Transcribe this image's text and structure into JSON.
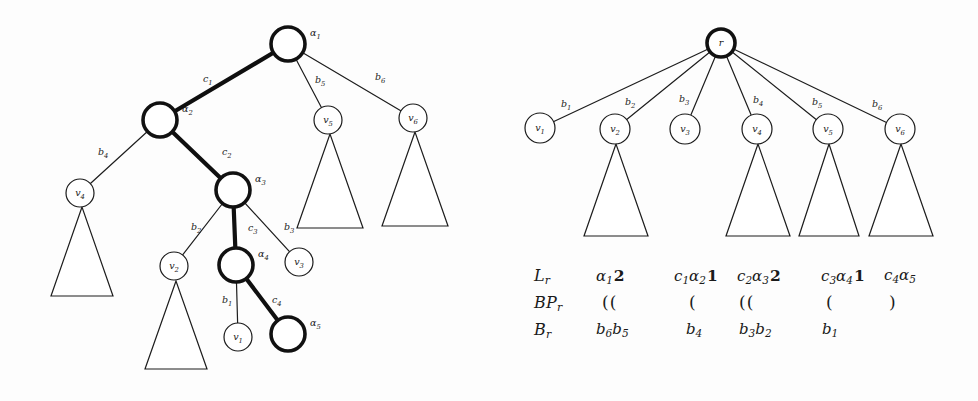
{
  "figure": {
    "left_tree": {
      "caption_role": "alpha-path-tree",
      "nodes": [
        {
          "id": "a1",
          "label": "α",
          "sub": "1",
          "x": 288,
          "y": 44,
          "r": 17,
          "style": "bold",
          "label_side": "right",
          "inner": ""
        },
        {
          "id": "a2",
          "label": "α",
          "sub": "2",
          "x": 160,
          "y": 120,
          "r": 17,
          "style": "bold",
          "label_side": "right",
          "inner": ""
        },
        {
          "id": "a3",
          "label": "α",
          "sub": "3",
          "x": 233,
          "y": 190,
          "r": 17,
          "style": "bold",
          "label_side": "right",
          "inner": ""
        },
        {
          "id": "a4",
          "label": "α",
          "sub": "4",
          "x": 236,
          "y": 265,
          "r": 17,
          "style": "bold",
          "label_side": "right",
          "inner": ""
        },
        {
          "id": "a5",
          "label": "α",
          "sub": "5",
          "x": 288,
          "y": 334,
          "r": 17,
          "style": "bold",
          "label_side": "right",
          "inner": ""
        },
        {
          "id": "v4",
          "label": "v",
          "sub": "4",
          "x": 80,
          "y": 193,
          "r": 14,
          "style": "thin",
          "label_side": "inside",
          "inner": "v4"
        },
        {
          "id": "v2",
          "label": "v",
          "sub": "2",
          "x": 174,
          "y": 266,
          "r": 14,
          "style": "thin",
          "label_side": "inside",
          "inner": "v2"
        },
        {
          "id": "v1",
          "label": "v",
          "sub": "1",
          "x": 238,
          "y": 337,
          "r": 14,
          "style": "thin",
          "label_side": "inside",
          "inner": "v1"
        },
        {
          "id": "v3",
          "label": "v",
          "sub": "3",
          "x": 299,
          "y": 262,
          "r": 14,
          "style": "thin",
          "label_side": "inside",
          "inner": "v3"
        },
        {
          "id": "v5",
          "label": "v",
          "sub": "5",
          "x": 328,
          "y": 120,
          "r": 14,
          "style": "thin",
          "label_side": "inside",
          "inner": "v5"
        },
        {
          "id": "v6",
          "label": "v",
          "sub": "6",
          "x": 413,
          "y": 118,
          "r": 14,
          "style": "thin",
          "label_side": "inside",
          "inner": "v6"
        }
      ],
      "edges": [
        {
          "from": "a1",
          "to": "a2",
          "label": "c",
          "sub": "1",
          "style": "bold",
          "lx": 203,
          "ly": 82
        },
        {
          "from": "a2",
          "to": "a3",
          "label": "c",
          "sub": "2",
          "style": "bold",
          "lx": 222,
          "ly": 155
        },
        {
          "from": "a3",
          "to": "a4",
          "label": "c",
          "sub": "3",
          "style": "bold",
          "lx": 248,
          "ly": 231
        },
        {
          "from": "a4",
          "to": "a5",
          "label": "c",
          "sub": "4",
          "style": "bold",
          "lx": 272,
          "ly": 303
        },
        {
          "from": "a2",
          "to": "v4",
          "label": "b",
          "sub": "4",
          "style": "thin",
          "lx": 98,
          "ly": 155
        },
        {
          "from": "a3",
          "to": "v2",
          "label": "b",
          "sub": "2",
          "style": "thin",
          "lx": 191,
          "ly": 230
        },
        {
          "from": "a3",
          "to": "v3",
          "label": "b",
          "sub": "3",
          "style": "thin",
          "lx": 284,
          "ly": 230
        },
        {
          "from": "a4",
          "to": "v1",
          "label": "b",
          "sub": "1",
          "style": "thin",
          "lx": 222,
          "ly": 303
        },
        {
          "from": "a1",
          "to": "v5",
          "label": "b",
          "sub": "5",
          "style": "thin",
          "lx": 315,
          "ly": 83
        },
        {
          "from": "a1",
          "to": "v6",
          "label": "b",
          "sub": "6",
          "style": "thin",
          "lx": 375,
          "ly": 80
        }
      ],
      "subtrees": [
        {
          "under": "v4",
          "apex_x": 82,
          "apex_y": 207,
          "half_w": 31,
          "bottom_y": 296
        },
        {
          "under": "v2",
          "apex_x": 176,
          "apex_y": 281,
          "half_w": 31,
          "bottom_y": 369
        },
        {
          "under": "v5",
          "apex_x": 330,
          "apex_y": 134,
          "half_w": 33,
          "bottom_y": 228
        },
        {
          "under": "v6",
          "apex_x": 415,
          "apex_y": 132,
          "half_w": 33,
          "bottom_y": 226
        }
      ]
    },
    "right_tree": {
      "caption_role": "root-r-tree",
      "nodes": [
        {
          "id": "r",
          "label": "r",
          "sub": "",
          "x": 721,
          "y": 43,
          "r": 14,
          "style": "bold",
          "label_side": "inside",
          "inner": "r"
        },
        {
          "id": "v1",
          "label": "v",
          "sub": "1",
          "x": 540,
          "y": 128,
          "r": 15,
          "style": "thin",
          "label_side": "inside",
          "inner": "v1"
        },
        {
          "id": "v2",
          "label": "v",
          "sub": "2",
          "x": 615,
          "y": 129,
          "r": 15,
          "style": "thin",
          "label_side": "inside",
          "inner": "v2"
        },
        {
          "id": "v3",
          "label": "v",
          "sub": "3",
          "x": 685,
          "y": 129,
          "r": 15,
          "style": "thin",
          "label_side": "inside",
          "inner": "v3"
        },
        {
          "id": "v4",
          "label": "v",
          "sub": "4",
          "x": 757,
          "y": 129,
          "r": 15,
          "style": "thin",
          "label_side": "inside",
          "inner": "v4"
        },
        {
          "id": "v5",
          "label": "v",
          "sub": "5",
          "x": 828,
          "y": 129,
          "r": 15,
          "style": "thin",
          "label_side": "inside",
          "inner": "v5"
        },
        {
          "id": "v6",
          "label": "v",
          "sub": "6",
          "x": 900,
          "y": 129,
          "r": 15,
          "style": "thin",
          "label_side": "inside",
          "inner": "v6"
        }
      ],
      "edges": [
        {
          "from": "r",
          "to": "v1",
          "label": "b",
          "sub": "1",
          "style": "thin",
          "lx": 561,
          "ly": 107
        },
        {
          "from": "r",
          "to": "v2",
          "label": "b",
          "sub": "2",
          "style": "thin",
          "lx": 625,
          "ly": 105
        },
        {
          "from": "r",
          "to": "v3",
          "label": "b",
          "sub": "3",
          "style": "thin",
          "lx": 679,
          "ly": 102
        },
        {
          "from": "r",
          "to": "v4",
          "label": "b",
          "sub": "4",
          "style": "thin",
          "lx": 753,
          "ly": 103
        },
        {
          "from": "r",
          "to": "v5",
          "label": "b",
          "sub": "5",
          "style": "thin",
          "lx": 812,
          "ly": 105
        },
        {
          "from": "r",
          "to": "v6",
          "label": "b",
          "sub": "6",
          "style": "thin",
          "lx": 872,
          "ly": 107
        }
      ],
      "subtrees": [
        {
          "under": "v2",
          "apex_x": 616,
          "apex_y": 144,
          "half_w": 32,
          "bottom_y": 236
        },
        {
          "under": "v4",
          "apex_x": 758,
          "apex_y": 144,
          "half_w": 32,
          "bottom_y": 236
        },
        {
          "under": "v5",
          "apex_x": 829,
          "apex_y": 144,
          "half_w": 30,
          "bottom_y": 236
        },
        {
          "under": "v6",
          "apex_x": 901,
          "apex_y": 144,
          "half_w": 32,
          "bottom_y": 236
        }
      ]
    }
  },
  "formulas": {
    "rows": [
      {
        "id": "Lr",
        "name_main": "L",
        "name_sub": "r",
        "cells": [
          {
            "x": 62,
            "html": "<span class=\"it\">α<span class=\"sub\">1</span></span><span class=\"cnt\">2</span>"
          },
          {
            "x": 140,
            "html": "<span class=\"it\">c<span class=\"sub\">1</span>α<span class=\"sub\">2</span></span><span class=\"cnt\">1</span>"
          },
          {
            "x": 203,
            "html": "<span class=\"it\">c<span class=\"sub\">2</span>α<span class=\"sub\">3</span></span><span class=\"cnt\">2</span>"
          },
          {
            "x": 287,
            "html": "<span class=\"it\">c<span class=\"sub\">3</span>α<span class=\"sub\">4</span></span><span class=\"cnt\">1</span>"
          },
          {
            "x": 350,
            "html": "<span class=\"it\">c<span class=\"sub\">4</span>α<span class=\"sub\">5</span></span>"
          }
        ]
      },
      {
        "id": "BPr",
        "name_main": "BP",
        "name_sub": "r",
        "cells": [
          {
            "x": 68,
            "html": "(("
          },
          {
            "x": 155,
            "html": "("
          },
          {
            "x": 205,
            "html": "(("
          },
          {
            "x": 292,
            "html": "("
          },
          {
            "x": 355,
            "html": ")"
          }
        ]
      },
      {
        "id": "Br",
        "name_main": "B",
        "name_sub": "r",
        "cells": [
          {
            "x": 62,
            "html": "<span class=\"it\">b<span class=\"sub\">6</span>b<span class=\"sub\">5</span></span>"
          },
          {
            "x": 152,
            "html": "<span class=\"it\">b<span class=\"sub\">4</span></span>"
          },
          {
            "x": 205,
            "html": "<span class=\"it\">b<span class=\"sub\">3</span>b<span class=\"sub\">2</span></span>"
          },
          {
            "x": 288,
            "html": "<span class=\"it\">b<span class=\"sub\">1</span></span>"
          }
        ]
      }
    ]
  }
}
